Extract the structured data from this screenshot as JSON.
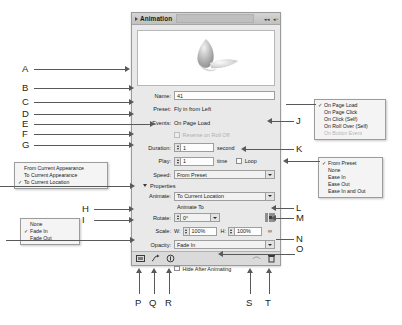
{
  "panel": {
    "title": "Animation",
    "preview_alt": "animation-preview-thumbnail",
    "fields": {
      "name_label": "Name:",
      "name_value": "41",
      "preset_label": "Preset:",
      "preset_value": "Fly in from Left",
      "events_label": "Events:",
      "events_value": "On Page Load",
      "reverse_label": "Reverse on Roll Off",
      "duration_label": "Duration:",
      "duration_value": "1",
      "duration_unit": "second",
      "play_label": "Play:",
      "play_value": "1",
      "play_unit": "time",
      "loop_label": "Loop",
      "speed_label": "Speed:",
      "speed_value": "From Preset",
      "properties_label": "Properties",
      "animate_label": "Animate:",
      "animate_value": "To Current Location",
      "animate_to_label": "Animate To",
      "rotate_label": "Rotate:",
      "rotate_value": "0°",
      "scale_label": "Scale:",
      "scale_w_label": "W:",
      "scale_w_value": "100%",
      "scale_h_label": "H:",
      "scale_h_value": "100%",
      "opacity_label": "Opacity:",
      "opacity_value": "Fade In",
      "visibility_label": "Visibility:",
      "hide_until_label": "Hide Until Animated",
      "hide_after_label": "Hide After Animating"
    },
    "footer_icons": [
      "preview-spread-icon",
      "convert-to-motion-path-icon",
      "create-button-trigger-icon",
      "manage-presets-icon",
      "delete-icon"
    ]
  },
  "menus": {
    "events": {
      "name": "events-menu",
      "items": [
        {
          "label": "On Page Load",
          "checked": true,
          "disabled": false
        },
        {
          "label": "On Page Click",
          "checked": false,
          "disabled": false
        },
        {
          "label": "On Click (Self)",
          "checked": false,
          "disabled": false
        },
        {
          "label": "On Roll Over (Self)",
          "checked": false,
          "disabled": false
        },
        {
          "label": "On Button Event",
          "checked": false,
          "disabled": true
        }
      ]
    },
    "speed": {
      "name": "speed-menu",
      "items": [
        {
          "label": "From Preset",
          "checked": true,
          "disabled": false
        },
        {
          "label": "None",
          "checked": false,
          "disabled": false
        },
        {
          "label": "Ease In",
          "checked": false,
          "disabled": false
        },
        {
          "label": "Ease Out",
          "checked": false,
          "disabled": false
        },
        {
          "label": "Ease In and Out",
          "checked": false,
          "disabled": false
        }
      ]
    },
    "animate": {
      "name": "animate-menu",
      "items": [
        {
          "label": "From Current Appearance",
          "checked": false,
          "disabled": false
        },
        {
          "label": "To Current Appearance",
          "checked": false,
          "disabled": false
        },
        {
          "label": "To Current Location",
          "checked": true,
          "disabled": false
        }
      ]
    },
    "opacity": {
      "name": "opacity-menu",
      "items": [
        {
          "label": "None",
          "checked": false,
          "disabled": false
        },
        {
          "label": "Fade In",
          "checked": true,
          "disabled": false
        },
        {
          "label": "Fade Out",
          "checked": false,
          "disabled": false
        }
      ]
    }
  },
  "callouts": {
    "a": "A",
    "b": "B",
    "c": "C",
    "d": "D",
    "e": "E",
    "f": "F",
    "g": "G",
    "h": "H",
    "i": "I",
    "j": "J",
    "k": "K",
    "l": "L",
    "m": "M",
    "n": "N",
    "o": "O",
    "p": "P",
    "q": "Q",
    "r": "R",
    "s": "S",
    "t": "T"
  },
  "colors": {
    "leader": "#58595b",
    "panel_bg": "#e9e9e9",
    "panel_title_bg": "#c9c9c9",
    "text": "#231f20"
  }
}
